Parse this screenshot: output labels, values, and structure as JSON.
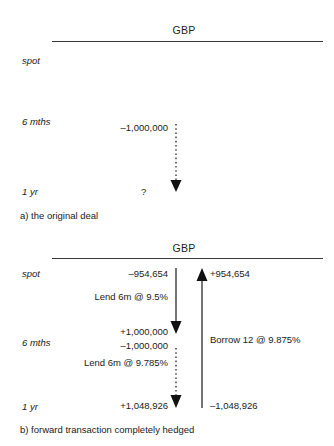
{
  "diagrams": [
    {
      "id": "original-deal",
      "axis_title": "GBP",
      "caption": "a) the original deal",
      "time_labels": [
        "spot",
        "6 mths",
        "1 yr"
      ],
      "flows": [
        {
          "name": "forward-outflow",
          "style": "dashed",
          "direction": "down",
          "start_label": "–1,000,000",
          "end_label": "?",
          "rate_label": ""
        }
      ]
    },
    {
      "id": "hedged-transaction",
      "axis_title": "GBP",
      "caption": "b) forward transaction completely hedged",
      "time_labels": [
        "spot",
        "6 mths",
        "1 yr"
      ],
      "flows": [
        {
          "name": "lend-6m-first",
          "style": "solid",
          "direction": "down",
          "start_label": "–954,654",
          "end_label": "+1,000,000",
          "rate_label": "Lend 6m @ 9.5%"
        },
        {
          "name": "lend-6m-second",
          "style": "dashed",
          "direction": "down",
          "start_label": "–1,000,000",
          "end_label": "+1,048,926",
          "rate_label": "Lend 6m @ 9.785%"
        },
        {
          "name": "borrow-12m",
          "style": "solid",
          "direction": "up",
          "start_label": "+954,654",
          "end_label": "–1,048,926",
          "rate_label": "Borrow 12 @ 9.875%"
        }
      ]
    }
  ],
  "colors": {
    "ink": "#1a1a1a",
    "rule": "#35383c",
    "background": "#ffffff"
  }
}
